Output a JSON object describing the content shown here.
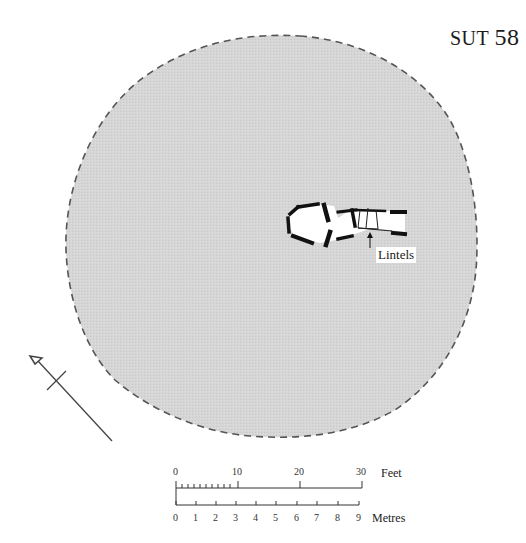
{
  "title": {
    "prefix": "SUT",
    "number": "58"
  },
  "annotation": {
    "label": "Lintels"
  },
  "scale": {
    "feet": {
      "unit": "Feet",
      "ticks": [
        "0",
        "10",
        "20",
        "30"
      ]
    },
    "metres": {
      "unit": "Metres",
      "ticks": [
        "0",
        "1",
        "2",
        "3",
        "4",
        "5",
        "6",
        "7",
        "8",
        "9"
      ]
    }
  },
  "colors": {
    "mound_fill": "#d4d4d4",
    "outline": "#555555",
    "walls": "#111111",
    "background": "#ffffff"
  },
  "north_arrow": {
    "icon": "north-arrow-icon"
  }
}
